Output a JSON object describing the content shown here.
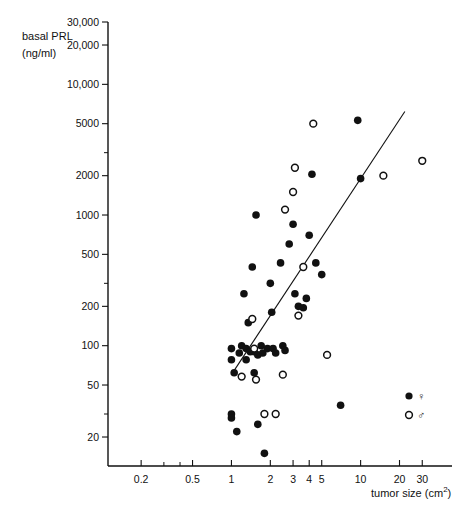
{
  "figure": {
    "ylabel_line1": "basal PRL",
    "ylabel_line2": "(ng/ml)",
    "xlabel_main": "tumor size (cm",
    "xlabel_sup": "2",
    "xlabel_close": ")"
  },
  "legend": {
    "female_symbol": "♀",
    "male_symbol": "♂",
    "female_marker": "filled-circle",
    "male_marker": "open-circle"
  },
  "chart_data": {
    "type": "scatter",
    "title": "",
    "xlabel": "tumor size (cm2)",
    "ylabel": "basal PRL (ng/ml)",
    "xscale": "log",
    "yscale": "log",
    "xlim": [
      0.15,
      45
    ],
    "ylim": [
      12,
      30000
    ],
    "grid": false,
    "legend_position": "bottom-right",
    "xticks": [
      0.2,
      0.3,
      0.4,
      0.5,
      1,
      2,
      3,
      4,
      5,
      10,
      20,
      30
    ],
    "xtick_labels": [
      "0.2",
      "",
      "",
      "0.5",
      "1",
      "2",
      "3",
      "4",
      "5",
      "10",
      "20",
      "30"
    ],
    "yticks": [
      20,
      30,
      50,
      100,
      200,
      300,
      500,
      1000,
      2000,
      3000,
      5000,
      10000,
      20000,
      30000
    ],
    "ytick_labels": [
      "20",
      "",
      "50",
      "100",
      "200",
      "",
      "500",
      "1000",
      "2000",
      "",
      "5000",
      "10,000",
      "20,000",
      "30,000"
    ],
    "series": [
      {
        "name": "♀",
        "marker": "filled-circle",
        "points": [
          [
            1.05,
            62
          ],
          [
            1.0,
            78
          ],
          [
            1.0,
            95
          ],
          [
            1.0,
            30
          ],
          [
            1.0,
            28
          ],
          [
            1.1,
            22
          ],
          [
            1.15,
            88
          ],
          [
            1.2,
            100
          ],
          [
            1.25,
            250
          ],
          [
            1.3,
            95
          ],
          [
            1.3,
            78
          ],
          [
            1.35,
            150
          ],
          [
            1.4,
            90
          ],
          [
            1.45,
            400
          ],
          [
            1.5,
            90
          ],
          [
            1.5,
            62
          ],
          [
            1.55,
            1000
          ],
          [
            1.6,
            85
          ],
          [
            1.6,
            25
          ],
          [
            1.7,
            100
          ],
          [
            1.75,
            88
          ],
          [
            1.8,
            15
          ],
          [
            1.9,
            95
          ],
          [
            2.0,
            300
          ],
          [
            2.05,
            180
          ],
          [
            2.1,
            95
          ],
          [
            2.2,
            88
          ],
          [
            2.4,
            430
          ],
          [
            2.5,
            100
          ],
          [
            2.6,
            92
          ],
          [
            2.8,
            600
          ],
          [
            3.0,
            850
          ],
          [
            3.1,
            250
          ],
          [
            3.3,
            200
          ],
          [
            3.6,
            195
          ],
          [
            3.8,
            230
          ],
          [
            4.0,
            700
          ],
          [
            4.2,
            2050
          ],
          [
            4.5,
            430
          ],
          [
            5.0,
            350
          ],
          [
            7.0,
            35
          ],
          [
            9.5,
            5300
          ],
          [
            10.0,
            1900
          ]
        ]
      },
      {
        "name": "♂",
        "marker": "open-circle",
        "points": [
          [
            1.2,
            58
          ],
          [
            1.45,
            160
          ],
          [
            1.5,
            95
          ],
          [
            1.55,
            55
          ],
          [
            1.8,
            30
          ],
          [
            2.2,
            30
          ],
          [
            2.5,
            60
          ],
          [
            2.6,
            1100
          ],
          [
            3.0,
            1500
          ],
          [
            3.1,
            2300
          ],
          [
            3.3,
            170
          ],
          [
            3.6,
            400
          ],
          [
            4.3,
            5000
          ],
          [
            5.5,
            85
          ],
          [
            15.0,
            2000
          ],
          [
            30.0,
            2600
          ]
        ]
      }
    ],
    "fit_line": {
      "x1": 1.0,
      "y1": 60,
      "x2": 22.0,
      "y2": 6200
    }
  }
}
